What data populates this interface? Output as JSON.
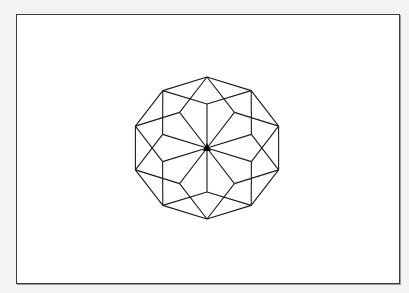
{
  "figure": {
    "center": [
      207,
      148
    ],
    "scale_x": 1.06,
    "spoke_count": 10,
    "spoke_radius": 44,
    "outer_radius": 71,
    "start_angle_deg": 90,
    "rhombus_span_deg": 72,
    "line_color": "#1a1a1a",
    "center_marker_color": "#000000",
    "frame_border_color": "#3a3a3a",
    "background_color": "#f3f3f3",
    "canvas_color": "#ffffff"
  }
}
